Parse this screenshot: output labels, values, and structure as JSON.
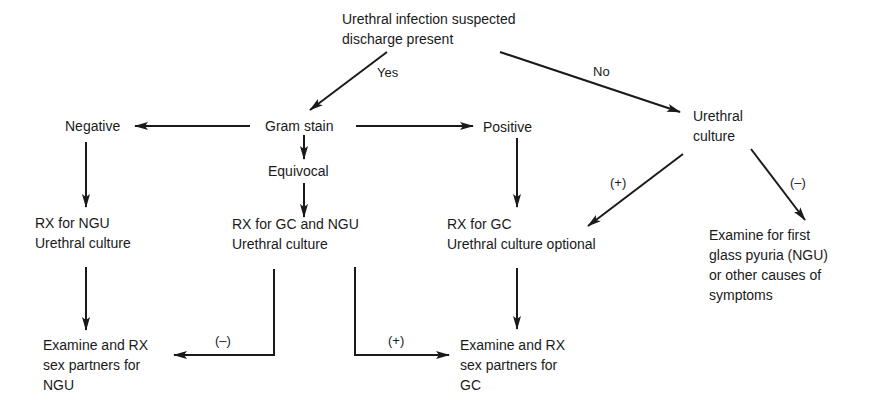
{
  "diagram": {
    "nodes": {
      "start": {
        "lines": [
          "Urethral infection suspected",
          "discharge present"
        ]
      },
      "gram_stain": {
        "lines": [
          "Gram stain"
        ]
      },
      "negative": {
        "lines": [
          "Negative"
        ]
      },
      "positive": {
        "lines": [
          "Positive"
        ]
      },
      "equivocal": {
        "lines": [
          "Equivocal"
        ]
      },
      "urethral_culture": {
        "lines": [
          "Urethral",
          "culture"
        ]
      },
      "rx_ngu": {
        "lines": [
          "RX for NGU",
          "Urethral culture"
        ]
      },
      "rx_gc_ngu": {
        "lines": [
          "RX for GC and NGU",
          "Urethral culture"
        ]
      },
      "rx_gc": {
        "lines": [
          "RX for GC",
          "Urethral culture optional"
        ]
      },
      "examine_pyuria": {
        "lines": [
          "Examine for first",
          "glass pyuria (NGU)",
          "or other causes of",
          "symptoms"
        ]
      },
      "partners_ngu": {
        "lines": [
          "Examine and RX",
          "sex partners for",
          "NGU"
        ]
      },
      "partners_gc": {
        "lines": [
          "Examine and RX",
          "sex partners for",
          "GC"
        ]
      }
    },
    "edge_labels": {
      "yes": "Yes",
      "no": "No",
      "culture_pos": "(+)",
      "culture_neg": "(–)",
      "equiv_neg": "(–)",
      "equiv_pos": "(+)"
    },
    "colors": {
      "ink": "#1a1a1a",
      "background": "#ffffff"
    }
  }
}
